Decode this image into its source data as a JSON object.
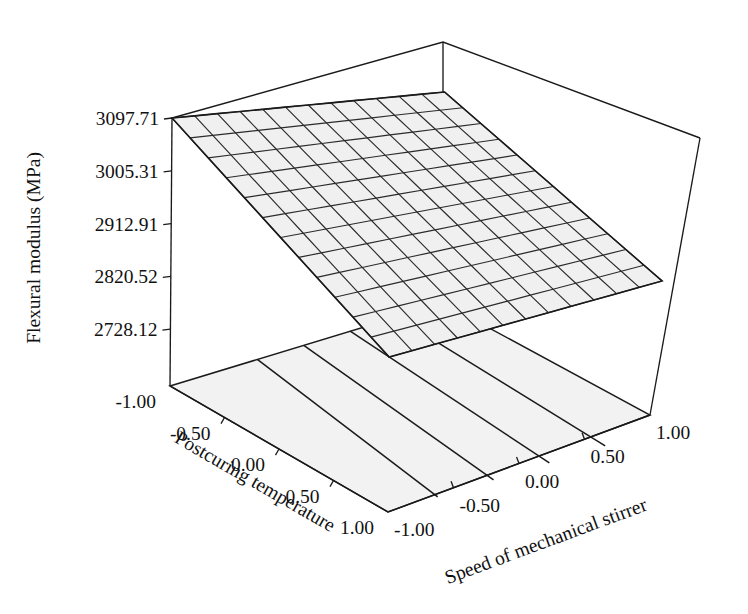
{
  "chart_data": {
    "type": "surface",
    "title": "",
    "zlabel": "Flexural modulus (MPa)",
    "xlabel": "Speed of mechanical stirrer",
    "ylabel": "Postcuring temperature",
    "z_ticks": [
      "3097.71",
      "3005.31",
      "2912.91",
      "2820.52",
      "2728.12"
    ],
    "z_tick_values": [
      3097.71,
      3005.31,
      2912.91,
      2820.52,
      2728.12
    ],
    "zlim": [
      2728.12,
      3097.71
    ],
    "x_ticks": [
      "-1.00",
      "-0.50",
      "0.00",
      "0.50",
      "1.00"
    ],
    "x_tick_values": [
      -1.0,
      -0.5,
      0.0,
      0.5,
      1.0
    ],
    "xlim": [
      -1.0,
      1.0
    ],
    "y_ticks": [
      "-1.00",
      "-0.50",
      "0.00",
      "0.50",
      "1.00"
    ],
    "y_tick_values": [
      -1.0,
      -0.5,
      0.0,
      0.5,
      1.0
    ],
    "ylim": [
      -1.0,
      1.0
    ],
    "surface": {
      "description": "planar response surface rising with postcuring temperature and speed of mechanical stirrer",
      "mesh_divisions": 12,
      "corner_values": {
        "x_low_y_low": 2728.12,
        "x_high_y_low": 2880.0,
        "x_low_y_high": 2950.0,
        "x_high_y_high": 3097.71
      },
      "grid_color": "#2b2b2b",
      "face_color": "#f0f0f0"
    },
    "floor_contours": {
      "count": 4,
      "orientation": "diagonal",
      "color": "#1a1a1a"
    },
    "grid": false,
    "legend": "none",
    "background_color": "#ffffff",
    "line_color": "#1a1a1a"
  },
  "geometry": {
    "box": {
      "origin": [
        170,
        386
      ],
      "x_end": [
        650,
        415
      ],
      "y_end": [
        388,
        512
      ],
      "apex": [
        443,
        42
      ],
      "z_top_left": [
        172,
        118
      ],
      "z_top_right": [
        700,
        138
      ],
      "z_top_front": [
        418,
        228
      ]
    },
    "surface_corners": {
      "left": [
        172,
        118
      ],
      "back": [
        443,
        92
      ],
      "right": [
        686,
        281
      ],
      "front": [
        390,
        357
      ]
    },
    "floor_corners": {
      "left": [
        170,
        386
      ],
      "back": [
        443,
        303
      ],
      "right": [
        650,
        415
      ],
      "front": [
        388,
        512
      ]
    }
  }
}
